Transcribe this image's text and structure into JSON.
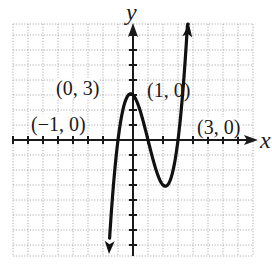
{
  "chart_data": {
    "type": "line",
    "title": "",
    "function": "f(x) = x^3 - 3x^2 - x + 3",
    "xlabel": "x",
    "ylabel": "y",
    "xlim": [
      -8,
      8
    ],
    "ylim": [
      -7.7,
      7.7
    ],
    "grid": true,
    "grid_step": 1,
    "legend": null,
    "series": [
      {
        "name": "f(x)",
        "x": [
          -1.6,
          -1.5,
          -1.25,
          -1,
          -0.75,
          -0.5,
          -0.25,
          0,
          0.155,
          0.25,
          0.5,
          0.75,
          1,
          1.25,
          1.5,
          1.75,
          2,
          2.155,
          2.5,
          2.75,
          3,
          3.25,
          3.5,
          3.75
        ],
        "values": [
          -7.18,
          -5.63,
          -2.86,
          0,
          1.83,
          2.63,
          2.8,
          3,
          3.08,
          2.83,
          2.38,
          1.23,
          0,
          -1.17,
          -2.63,
          -2.58,
          -3,
          -3.08,
          -2.63,
          -1.73,
          0,
          2.2,
          5.63,
          9.36
        ]
      }
    ],
    "annotations": [
      {
        "text": "(0, 3)",
        "x": 0,
        "y": 3
      },
      {
        "text": "(1, 0)",
        "x": 1,
        "y": 0
      },
      {
        "text": "(−1, 0)",
        "x": -1,
        "y": 0
      },
      {
        "text": "(3, 0)",
        "x": 3,
        "y": 0
      }
    ]
  },
  "labels": {
    "x_axis": "x",
    "y_axis": "y",
    "p_max": "(0, 3)",
    "p_one": "(1, 0)",
    "p_neg_one": "(−1, 0)",
    "p_three": "(3, 0)"
  },
  "colors": {
    "curve": "#111111",
    "axis": "#1a1a1a",
    "grid": "#9a9a9a",
    "background": "#ffffff"
  }
}
